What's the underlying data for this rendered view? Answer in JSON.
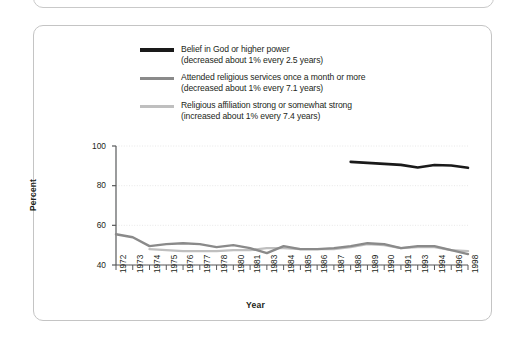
{
  "chart_data": {
    "type": "line",
    "title": "",
    "xlabel": "Year",
    "ylabel": "Percent",
    "ylim": [
      40,
      100
    ],
    "yticks": [
      40,
      60,
      80,
      100
    ],
    "grid": "horizontal-dotted",
    "legend_position": "top-center",
    "x": [
      1972,
      1973,
      1974,
      1975,
      1976,
      1977,
      1978,
      1980,
      1981,
      1983,
      1984,
      1985,
      1986,
      1987,
      1988,
      1989,
      1990,
      1991,
      1993,
      1994,
      1996,
      1998
    ],
    "categories": [
      "1972",
      "1973",
      "1974",
      "1975",
      "1976",
      "1977",
      "1978",
      "1980",
      "1981",
      "1983",
      "1984",
      "1985",
      "1986",
      "1987",
      "1988",
      "1989",
      "1990",
      "1991",
      "1993",
      "1994",
      "1996",
      "1998"
    ],
    "series": [
      {
        "name": "Belief in God or higher power",
        "annotation": "(decreased about 1% every 2.5 years)",
        "color": "#1a1a1a",
        "width": 2.6,
        "x": [
          1988,
          1989,
          1990,
          1991,
          1993,
          1994,
          1996,
          1998
        ],
        "values": [
          92,
          91.5,
          91,
          90.5,
          89.2,
          90.4,
          90.2,
          89
        ]
      },
      {
        "name": "Attended religious services once a month or more",
        "annotation": "(decreased about 1% every 7.1 years)",
        "color": "#8a8a8a",
        "width": 2.4,
        "x": [
          1972,
          1973,
          1974,
          1975,
          1976,
          1977,
          1978,
          1980,
          1981,
          1983,
          1984,
          1985,
          1986,
          1987,
          1988,
          1989,
          1990,
          1991,
          1993,
          1994,
          1996,
          1998
        ],
        "values": [
          55.5,
          54.0,
          49.5,
          50.5,
          51.0,
          50.5,
          49.0,
          50.0,
          48.5,
          46.0,
          49.5,
          48.0,
          48.0,
          48.5,
          49.5,
          51.0,
          50.5,
          48.5,
          49.5,
          49.5,
          47.5,
          45.5
        ]
      },
      {
        "name": "Religious affiliation strong or somewhat strong",
        "annotation": "(increased about 1% every 7.4 years)",
        "color": "#bfbfbf",
        "width": 2.4,
        "x": [
          1974,
          1975,
          1976,
          1977,
          1978,
          1980,
          1981,
          1983,
          1984,
          1985,
          1986,
          1987,
          1988,
          1989,
          1990,
          1991,
          1993,
          1994,
          1996,
          1998
        ],
        "values": [
          48.0,
          47.5,
          47.0,
          47.0,
          47.0,
          47.5,
          47.5,
          48.5,
          48.5,
          48.0,
          48.0,
          48.0,
          49.0,
          50.5,
          50.0,
          48.5,
          49.0,
          49.0,
          47.5,
          47.0
        ]
      }
    ]
  },
  "legend": {
    "items": [
      {
        "label": "Belief in God or higher power",
        "sub": "(decreased about 1% every 2.5 years)",
        "color": "#1a1a1a"
      },
      {
        "label": "Attended religious services once a month or more",
        "sub": "(decreased about 1% every 7.1 years)",
        "color": "#8a8a8a"
      },
      {
        "label": "Religious affiliation strong or somewhat strong",
        "sub": "(increased about 1% every 7.4 years)",
        "color": "#bfbfbf"
      }
    ]
  },
  "axes": {
    "y_title": "Percent",
    "x_title": "Year",
    "y_ticks": [
      "100",
      "80",
      "60",
      "40"
    ],
    "x_ticks": [
      "1972",
      "1973",
      "1974",
      "1975",
      "1976",
      "1977",
      "1978",
      "1980",
      "1981",
      "1983",
      "1984",
      "1985",
      "1986",
      "1987",
      "1988",
      "1989",
      "1990",
      "1991",
      "1993",
      "1994",
      "1996",
      "1998"
    ]
  },
  "colors": {
    "series_1": "#1a1a1a",
    "series_2": "#8a8a8a",
    "series_3": "#bfbfbf",
    "axis": "#58595b",
    "grid": "#e2e2e2",
    "frame": "#c4c4c4",
    "text": "#231f20"
  }
}
